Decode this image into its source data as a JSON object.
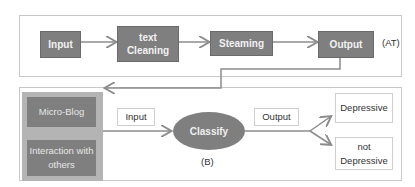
{
  "top_panel": {
    "nodes": [
      {
        "id": "input",
        "label": "Input"
      },
      {
        "id": "text-cleaning",
        "label": "text\nCleaning"
      },
      {
        "id": "steaming",
        "label": "Steaming"
      },
      {
        "id": "output",
        "label": "Output"
      }
    ],
    "tag": "(AT)"
  },
  "bottom_panel": {
    "sources": [
      {
        "id": "micro-blog",
        "label": "Micro-Blog"
      },
      {
        "id": "interaction",
        "label": "Interaction with others"
      }
    ],
    "input_label": "Input",
    "classify_label": "Classify",
    "tag": "(B)",
    "output_label": "Output",
    "results": [
      {
        "id": "depressive",
        "label": "Depressive"
      },
      {
        "id": "not-depressive",
        "label": "not Depressive"
      }
    ]
  },
  "colors": {
    "box_fill": "#7f7f7f",
    "side_fill": "#b4b4b4",
    "arrow": "#8c8c8c",
    "border": "#c8c8c8"
  }
}
